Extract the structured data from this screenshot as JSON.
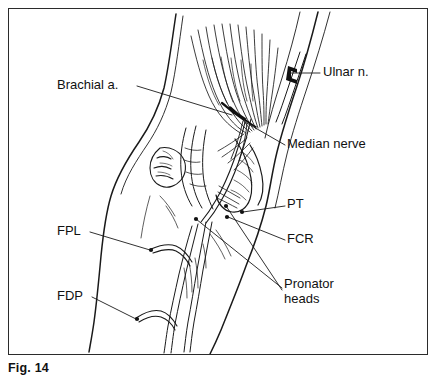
{
  "figure": {
    "caption": "Fig. 14",
    "frame": {
      "border_color": "#2b2b2b",
      "background": "#ffffff"
    },
    "ink_color": "#1a1a1a",
    "labels": [
      {
        "id": "brachial-a",
        "text": "Brachial a.",
        "x": 57,
        "y": 84,
        "align": "left",
        "lines": 1
      },
      {
        "id": "ulnar-n",
        "text": "Ulnar n.",
        "x": 323,
        "y": 71,
        "align": "left",
        "lines": 1
      },
      {
        "id": "median-nerve",
        "text": "Median nerve",
        "x": 287,
        "y": 143,
        "align": "left",
        "lines": 1
      },
      {
        "id": "pt",
        "text": "PT",
        "x": 287,
        "y": 203,
        "align": "left",
        "lines": 1
      },
      {
        "id": "fcr",
        "text": "FCR",
        "x": 287,
        "y": 238,
        "align": "left",
        "lines": 1
      },
      {
        "id": "pronator-heads",
        "text": "Pronator\nheads",
        "x": 284,
        "y": 283,
        "align": "left",
        "lines": 2
      },
      {
        "id": "fpl",
        "text": "FPL",
        "x": 57,
        "y": 230,
        "align": "left",
        "lines": 1
      },
      {
        "id": "fdp",
        "text": "FDP",
        "x": 57,
        "y": 295,
        "align": "left",
        "lines": 1
      }
    ]
  }
}
